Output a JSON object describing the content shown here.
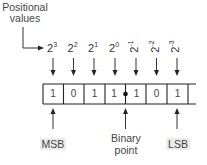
{
  "diagram": {
    "title_line1": "Positional",
    "title_line2": "values",
    "base": "2",
    "positions": [
      {
        "exp": "3",
        "bit": "1",
        "rotated": false
      },
      {
        "exp": "2",
        "bit": "0",
        "rotated": false
      },
      {
        "exp": "1",
        "bit": "1",
        "rotated": false
      },
      {
        "exp": "0",
        "bit": "1",
        "rotated": false
      },
      {
        "exp": "-1",
        "bit": "1",
        "rotated": true
      },
      {
        "exp": "-2",
        "bit": "0",
        "rotated": true
      },
      {
        "exp": "-3",
        "bit": "1",
        "rotated": true
      }
    ],
    "msb_label": "MSB",
    "lsb_label": "LSB",
    "point_label_line1": "Binary",
    "point_label_line2": "point",
    "colors": {
      "line": "#222222",
      "text": "#444444",
      "label_bg": "#ececec"
    }
  }
}
